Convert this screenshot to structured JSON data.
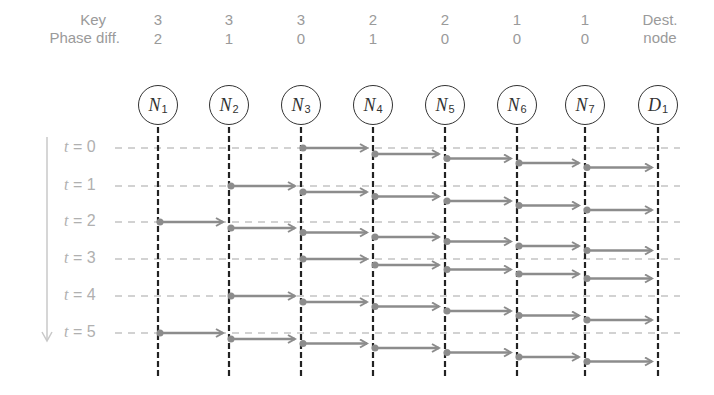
{
  "header": {
    "key_label": "Key",
    "phase_label": "Phase diff.",
    "dest_label_line1": "Dest.",
    "dest_label_line2": "node"
  },
  "nodes": [
    {
      "name": "N",
      "sub": "1",
      "key": "3",
      "phase": "2",
      "x": 158
    },
    {
      "name": "N",
      "sub": "2",
      "key": "3",
      "phase": "1",
      "x": 229
    },
    {
      "name": "N",
      "sub": "3",
      "key": "3",
      "phase": "0",
      "x": 301
    },
    {
      "name": "N",
      "sub": "4",
      "key": "2",
      "phase": "1",
      "x": 373
    },
    {
      "name": "N",
      "sub": "5",
      "key": "2",
      "phase": "0",
      "x": 445
    },
    {
      "name": "N",
      "sub": "6",
      "key": "1",
      "phase": "0",
      "x": 517
    },
    {
      "name": "N",
      "sub": "7",
      "key": "1",
      "phase": "0",
      "x": 585
    },
    {
      "name": "D",
      "sub": "1",
      "key": "",
      "phase": "",
      "x": 658
    }
  ],
  "time_rows": [
    {
      "label_var": "t",
      "label_rest": " = 0",
      "y": 148,
      "start_node": 2
    },
    {
      "label_var": "t",
      "label_rest": " = 1",
      "y": 186,
      "start_node": 1
    },
    {
      "label_var": "t",
      "label_rest": " = 2",
      "y": 222,
      "start_node": 0
    },
    {
      "label_var": "t",
      "label_rest": " = 3",
      "y": 259,
      "start_node": 2
    },
    {
      "label_var": "t",
      "label_rest": " = 4",
      "y": 296,
      "start_node": 1
    },
    {
      "label_var": "t",
      "label_rest": " = 5",
      "y": 333,
      "start_node": 0
    }
  ],
  "colors": {
    "arrow": "#8c8c8c",
    "guide": "#c4c4c4",
    "node_line": "#222222",
    "time_axis": "#c8c8c8"
  }
}
